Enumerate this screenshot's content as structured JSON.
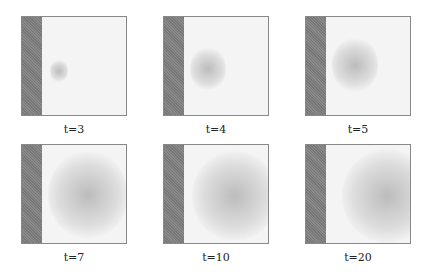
{
  "figure": {
    "panels": [
      {
        "label": "t=3",
        "x": 21,
        "y": 16,
        "cx": 8,
        "cy": 42,
        "cw": 18,
        "ch": 24
      },
      {
        "label": "t=4",
        "x": 163,
        "y": 16,
        "cx": 6,
        "cy": 30,
        "cw": 36,
        "ch": 44
      },
      {
        "label": "t=5",
        "x": 305,
        "y": 16,
        "cx": 6,
        "cy": 20,
        "cw": 46,
        "ch": 56
      },
      {
        "label": "t=7",
        "x": 21,
        "y": 144,
        "cx": 6,
        "cy": 6,
        "cw": 80,
        "ch": 88
      },
      {
        "label": "t=10",
        "x": 163,
        "y": 144,
        "cx": 8,
        "cy": 6,
        "cw": 86,
        "ch": 90
      },
      {
        "label": "t=20",
        "x": 305,
        "y": 144,
        "cx": 16,
        "cy": 4,
        "cw": 90,
        "ch": 94
      }
    ]
  }
}
